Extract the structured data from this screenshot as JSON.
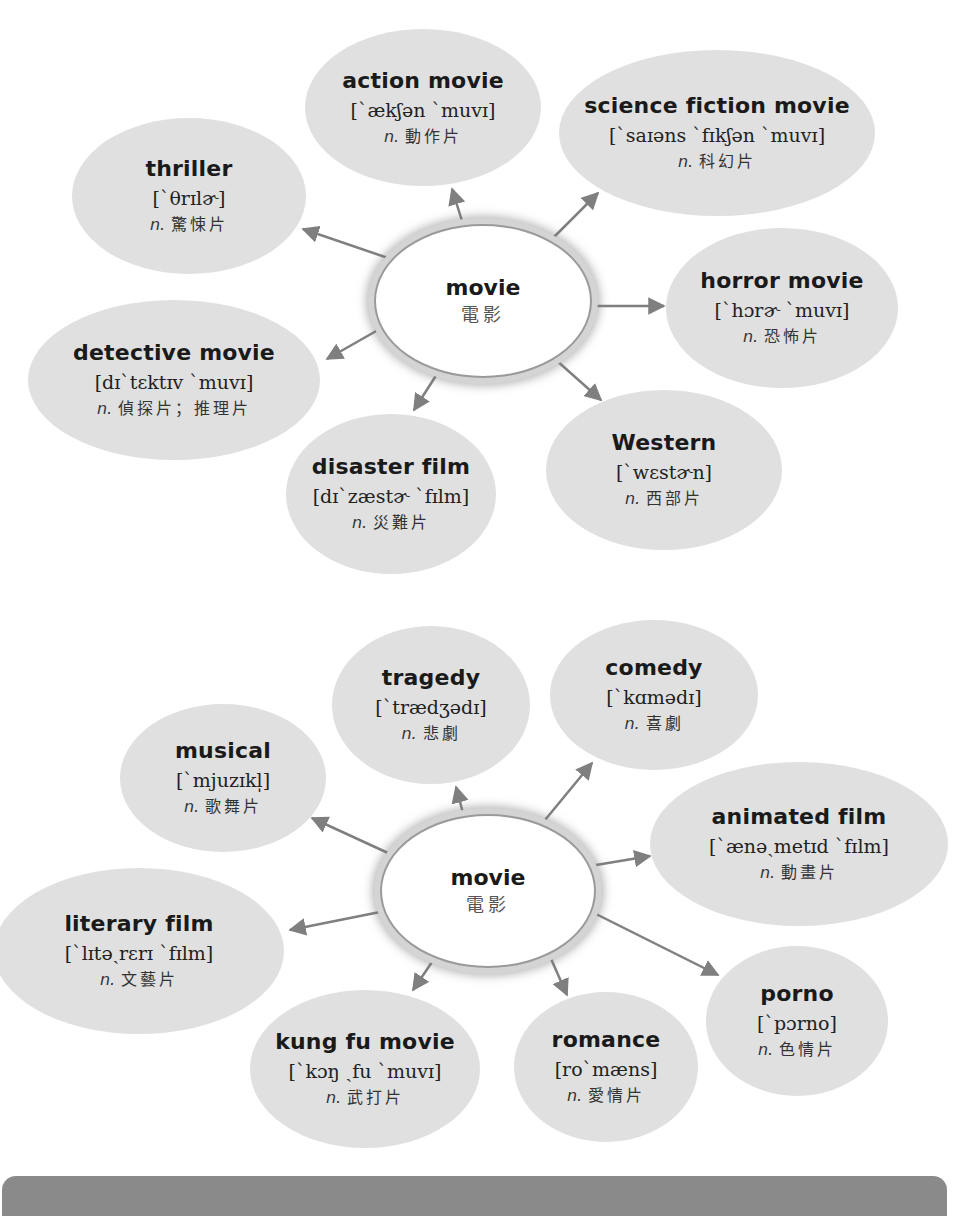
{
  "diagram_1": {
    "center": {
      "term": "movie",
      "zh": "電影"
    },
    "nodes": [
      {
        "id": "thriller",
        "term": "thriller",
        "ipa": "[`θrɪlɚ]",
        "pos": "n.",
        "zh": "驚悚片"
      },
      {
        "id": "action-movie",
        "term": "action movie",
        "ipa": "[`ækʃən `muvɪ]",
        "pos": "n.",
        "zh": "動作片"
      },
      {
        "id": "science-fiction-movie",
        "term": "science fiction movie",
        "ipa": "[`saɪəns `fɪkʃən `muvɪ]",
        "pos": "n.",
        "zh": "科幻片"
      },
      {
        "id": "horror-movie",
        "term": "horror movie",
        "ipa": "[`hɔrɚ `muvɪ]",
        "pos": "n.",
        "zh": "恐怖片"
      },
      {
        "id": "detective-movie",
        "term": "detective movie",
        "ipa": "[dɪ`tɛktɪv `muvɪ]",
        "pos": "n.",
        "zh": "偵探片；推理片"
      },
      {
        "id": "disaster-film",
        "term": "disaster film",
        "ipa": "[dɪ`zæstɚ `fɪlm]",
        "pos": "n.",
        "zh": "災難片"
      },
      {
        "id": "western",
        "term": "Western",
        "ipa": "[`wɛstɚn]",
        "pos": "n.",
        "zh": "西部片"
      }
    ]
  },
  "diagram_2": {
    "center": {
      "term": "movie",
      "zh": "電影"
    },
    "nodes": [
      {
        "id": "musical",
        "term": "musical",
        "ipa": "[`mjuzɪkl̩]",
        "pos": "n.",
        "zh": "歌舞片"
      },
      {
        "id": "tragedy",
        "term": "tragedy",
        "ipa": "[`trædʒədɪ]",
        "pos": "n.",
        "zh": "悲劇"
      },
      {
        "id": "comedy",
        "term": "comedy",
        "ipa": "[`kɑmədɪ]",
        "pos": "n.",
        "zh": "喜劇"
      },
      {
        "id": "animated-film",
        "term": "animated film",
        "ipa": "[`ænəˏmetɪd `fɪlm]",
        "pos": "n.",
        "zh": "動畫片"
      },
      {
        "id": "literary-film",
        "term": "literary film",
        "ipa": "[`lɪtəˏrɛrɪ `fɪlm]",
        "pos": "n.",
        "zh": "文藝片"
      },
      {
        "id": "kung-fu-movie",
        "term": "kung fu movie",
        "ipa": "[`kɔŋ ˏfu `muvɪ]",
        "pos": "n.",
        "zh": "武打片"
      },
      {
        "id": "romance",
        "term": "romance",
        "ipa": "[ro`mæns]",
        "pos": "n.",
        "zh": "愛情片"
      },
      {
        "id": "porno",
        "term": "porno",
        "ipa": "[`pɔrno]",
        "pos": "n.",
        "zh": "色情片"
      }
    ]
  },
  "colors": {
    "bubble": "#e0e0e0",
    "arrow": "#7f7f7f",
    "footer": "#8a8a8a",
    "text": "#1a1a1a"
  }
}
